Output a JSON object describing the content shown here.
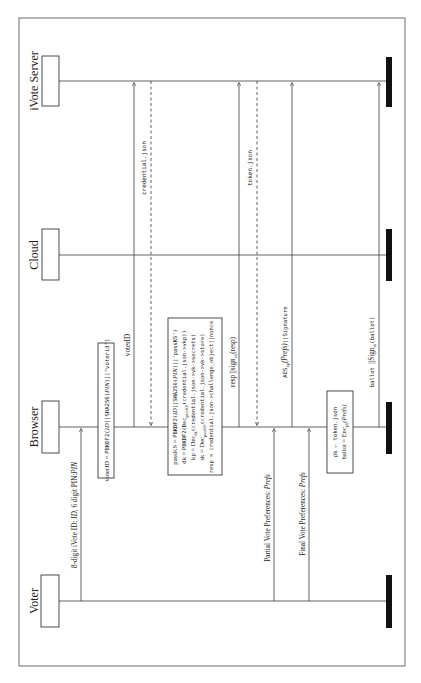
{
  "diagram": {
    "type": "sequence",
    "orientation": "rotated-90-ccw",
    "actors": [
      {
        "id": "voter",
        "label": "Voter"
      },
      {
        "id": "browser",
        "label": "Browser"
      },
      {
        "id": "cloud",
        "label": "Cloud"
      },
      {
        "id": "ivote",
        "label": "iVote Server"
      }
    ],
    "messages": [
      {
        "from": "voter",
        "to": "browser",
        "style": "solid",
        "label": "8-digit iVote ID: ID, 6 digit PIN: PIN"
      },
      {
        "note_on": "browser",
        "label": "voterID = PBKDF2(ID||SHA256(PIN)||\"voterid\")"
      },
      {
        "from": "browser",
        "to": "ivote",
        "style": "solid",
        "label": "voterID"
      },
      {
        "from": "ivote",
        "to": "browser",
        "style": "dashed",
        "label": "credential.json"
      },
      {
        "note_on": "browser",
        "lines": [
          "passKS = PBKDF2(ID||SHA256(PIN)||\"passKS\")",
          "dk = PBKDF2(Dec_passKS(credential.json->vkp))",
          "kp = Dec_dk(credential.json->vk->secrets)",
          "sk = Dec_passKS(credential.json->vk->store)",
          "resp = credential.json->challenge_object||nonce"
        ]
      },
      {
        "from": "browser",
        "to": "ivote",
        "style": "solid",
        "label": "resp ||sign_sk(resp)"
      },
      {
        "from": "ivote",
        "to": "browser",
        "style": "dashed",
        "label": "token.json"
      },
      {
        "from": "voter",
        "to": "browser",
        "style": "solid",
        "label": "Partial Vote Preferences: Prefs"
      },
      {
        "from": "browser",
        "to": "ivote",
        "style": "solid",
        "label": "AES_kp(Prefs)||Signature"
      },
      {
        "from": "voter",
        "to": "browser",
        "style": "solid",
        "label": "Final Vote Preferences: Prefs"
      },
      {
        "note_on": "browser",
        "lines": [
          "pk ← token.json",
          "ballot = Enc_pk(Prefs)"
        ]
      },
      {
        "from": "browser",
        "to": "ivote",
        "style": "solid",
        "label": "ballot ||Sign_sk(ballot)"
      }
    ]
  },
  "labels": {
    "voter": "Voter",
    "browser": "Browser",
    "cloud": "Cloud",
    "ivote": "iVote Server",
    "msg1_a": "8-digit iVote ID: ",
    "msg1_b": "ID",
    "msg1_c": ", 6 digit PIN:",
    "msg1_d": "PIN",
    "note1_a": "voterID = ",
    "note1_b": "PBKDF2(",
    "note1_c": "ID",
    "note1_d": "||SHA256(",
    "note1_e": "PIN",
    "note1_f": ")||\"voterid\")",
    "msg2": "voterID",
    "msg3": "credential.json",
    "note2_l1": "passKS = PBKDF2(ID||SHA256(PIN)||\"passKS\")",
    "note2_l2": "dk = PBKDF2(Decₚₐₛₛₖₛ(credential.json->vkp))",
    "note2_l3": "kp = Dec_dk(credential.json->vk->secrets)",
    "note2_l4": "sk = Dec_passKS(credential.json->vk->store)",
    "note2_l5": "resp = credential.json->challenge_object||nonce",
    "msg4": "resp ||sign",
    "msg4_sub": "sk",
    "msg4_tail": "(resp)",
    "msg5": "token.json",
    "msg6_a": "Partial Vote Preferences: ",
    "msg6_b": "Prefs",
    "msg7_a": "AES",
    "msg7_sub": "kp",
    "msg7_b": "(Prefs)",
    "msg7_c": "||Signature",
    "msg8_a": "Final Vote Preferences: ",
    "msg8_b": "Prefs",
    "note3_l1_a": "pk ← ",
    "note3_l1_b": "token.json",
    "note3_l2_a": "ballot = Enc",
    "note3_l2_sub": "pk",
    "note3_l2_b": "(Prefs)",
    "msg9_a": "ballot ",
    "msg9_b": "||Sign",
    "msg9_sub": "sk",
    "msg9_c": "(ballot)"
  }
}
